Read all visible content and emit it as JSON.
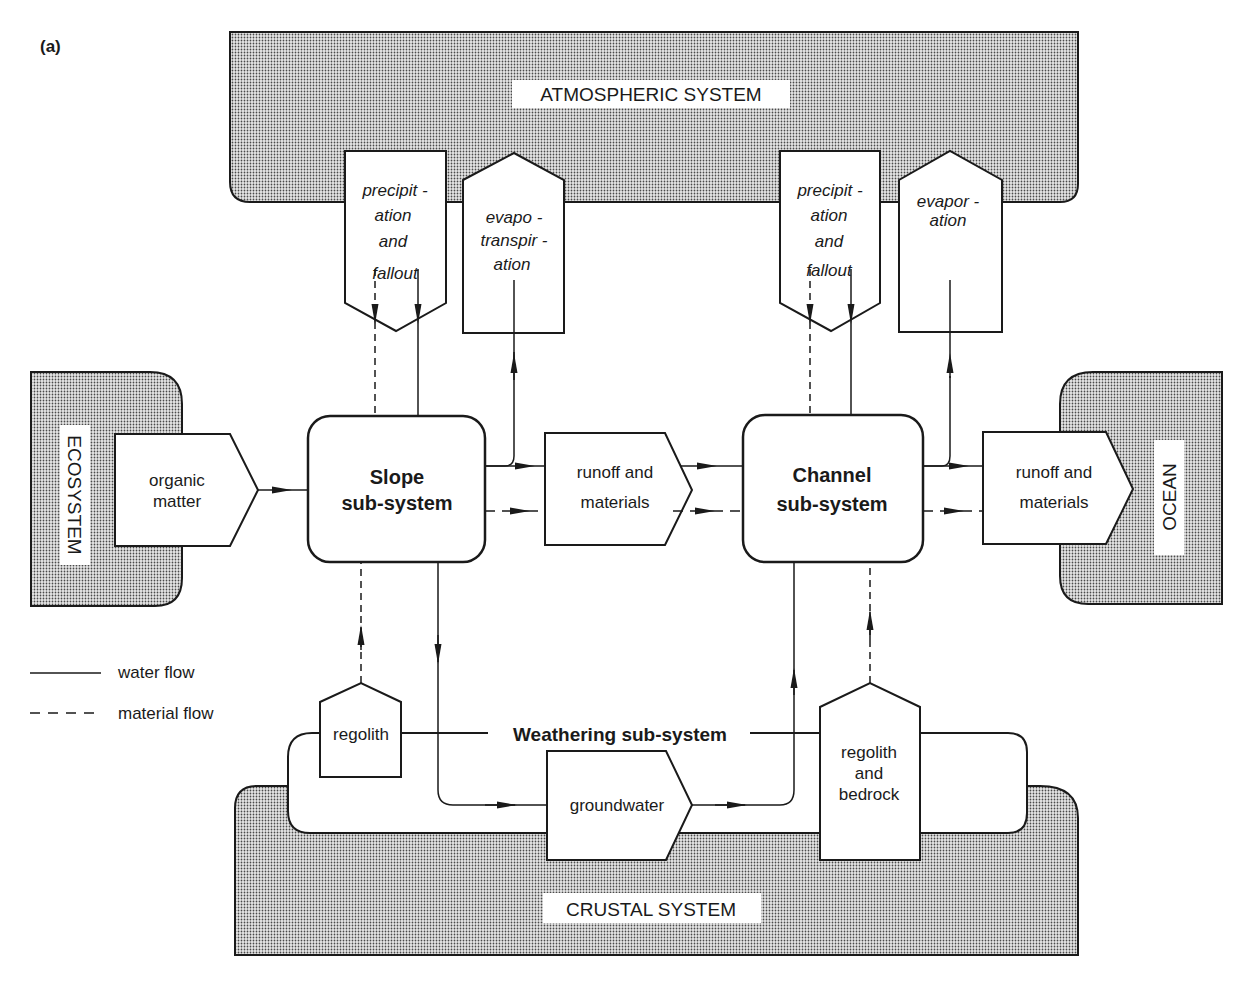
{
  "figure_label": "(a)",
  "systems": {
    "atmospheric": "ATMOSPHERIC SYSTEM",
    "ecosystem": "ECOSYSTEM",
    "ocean": "OCEAN",
    "crustal": "CRUSTAL SYSTEM",
    "weathering": "Weathering sub-system"
  },
  "subsystems": {
    "slope": {
      "line1": "Slope",
      "line2": "sub-system"
    },
    "channel": {
      "line1": "Channel",
      "line2": "sub-system"
    }
  },
  "stores": {
    "precip_left": {
      "l1": "precipit -",
      "l2": "ation",
      "l3": "and",
      "l4": "fallout"
    },
    "evapotranspiration": {
      "l1": "evapo -",
      "l2": "transpir -",
      "l3": "ation"
    },
    "precip_right": {
      "l1": "precipit -",
      "l2": "ation",
      "l3": "and",
      "l4": "fallout"
    },
    "evaporation": {
      "l1": "evapor -",
      "l2": "ation"
    },
    "organic_matter": {
      "l1": "organic",
      "l2": "matter"
    },
    "runoff_mid": {
      "l1": "runoff and",
      "l2": "materials"
    },
    "runoff_right": {
      "l1": "runoff and",
      "l2": "materials"
    },
    "regolith": {
      "l1": "regolith"
    },
    "groundwater": {
      "l1": "groundwater"
    },
    "regolith_bedrock": {
      "l1": "regolith",
      "l2": "and",
      "l3": "bedrock"
    }
  },
  "legend": {
    "water": "water flow",
    "material": "material flow"
  },
  "colors": {
    "line": "#1a1a1a",
    "stipple_fg": "#555555",
    "stipple_bg": "#e6e6e6"
  }
}
